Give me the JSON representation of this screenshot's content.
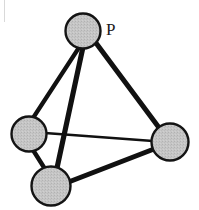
{
  "figure": {
    "width": 199,
    "height": 210,
    "background_color": "#ffffff"
  },
  "style": {
    "sphere_fill": "#c2c2c2",
    "sphere_stroke": "#141414",
    "sphere_stroke_width": 2.4,
    "bond_color": "#111111",
    "label_color": "#1a1a1a",
    "edge_artifact_color": "#d9d9d9"
  },
  "atoms": [
    {
      "id": "atom-top",
      "name": "top-vertex-atom",
      "label": "P",
      "label_x": 106,
      "label_y": 35,
      "cx": 83,
      "cy": 31,
      "r": 17.5
    },
    {
      "id": "atom-left",
      "name": "left-vertex-atom",
      "label": "",
      "label_x": 0,
      "label_y": 0,
      "cx": 29,
      "cy": 134,
      "r": 17.5
    },
    {
      "id": "atom-right",
      "name": "right-vertex-atom",
      "label": "",
      "label_x": 0,
      "label_y": 0,
      "cx": 170,
      "cy": 142,
      "r": 18.5
    },
    {
      "id": "atom-bottom",
      "name": "bottom-vertex-atom",
      "label": "",
      "label_x": 0,
      "label_y": 0,
      "cx": 51,
      "cy": 186,
      "r": 19.5
    }
  ],
  "bonds": [
    {
      "id": "bond-top-left",
      "name": "bond-top-to-left",
      "from": "atom-top",
      "to": "atom-left",
      "x1": 80,
      "y1": 46,
      "x2": 33,
      "y2": 118,
      "width": 4.2
    },
    {
      "id": "bond-top-bottom",
      "name": "bond-top-to-bottom",
      "from": "atom-top",
      "to": "atom-bottom",
      "x1": 83,
      "y1": 47,
      "x2": 57,
      "y2": 168,
      "width": 5.2
    },
    {
      "id": "bond-top-right",
      "name": "bond-top-to-right",
      "from": "atom-top",
      "to": "atom-right",
      "x1": 96,
      "y1": 43,
      "x2": 160,
      "y2": 129,
      "width": 5.0
    },
    {
      "id": "bond-left-right",
      "name": "bond-left-to-right",
      "from": "atom-left",
      "to": "atom-right",
      "x1": 45,
      "y1": 133,
      "x2": 153,
      "y2": 141,
      "width": 2.6
    },
    {
      "id": "bond-left-bottom",
      "name": "bond-left-to-bottom",
      "from": "atom-left",
      "to": "atom-bottom",
      "x1": 33,
      "y1": 150,
      "x2": 45,
      "y2": 169,
      "width": 4.4
    },
    {
      "id": "bond-bottom-right",
      "name": "bond-bottom-to-right",
      "from": "atom-bottom",
      "to": "atom-right",
      "x1": 66,
      "y1": 183,
      "x2": 154,
      "y2": 149,
      "width": 5.0
    }
  ],
  "artifacts": [
    {
      "id": "left-edge-line",
      "name": "scan-edge-artifact",
      "x": 4,
      "y": 0,
      "width": 1,
      "height": 22
    }
  ]
}
